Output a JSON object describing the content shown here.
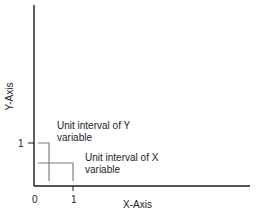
{
  "diagram": {
    "x_axis_label": "X-Axis",
    "y_axis_label": "Y-Axis",
    "origin_label": "0",
    "x_tick_label": "1",
    "y_tick_label": "1",
    "y_interval_label_line1": "Unit interval of Y",
    "y_interval_label_line2": "variable",
    "x_interval_label_line1": "Unit interval of X",
    "x_interval_label_line2": "variable",
    "colors": {
      "axis": "#1a1a1a",
      "bracket": "#808080",
      "text": "#222222"
    }
  }
}
